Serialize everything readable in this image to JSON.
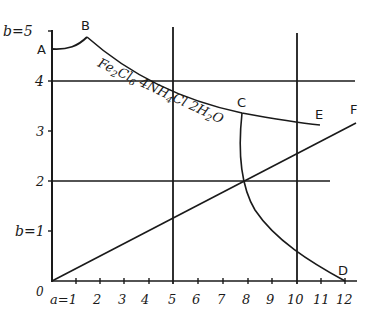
{
  "diagram": {
    "type": "phase-diagram",
    "y_axis": {
      "name": "b",
      "ticks": [
        {
          "label": "b=5",
          "value": 5
        },
        {
          "label": "4",
          "value": 4
        },
        {
          "label": "3",
          "value": 3
        },
        {
          "label": "2",
          "value": 2
        },
        {
          "label": "b=1",
          "value": 1
        }
      ],
      "origin_label": "0"
    },
    "x_axis": {
      "name": "a",
      "ticks": [
        {
          "label": "a=1",
          "value": 1
        },
        {
          "label": "2",
          "value": 2
        },
        {
          "label": "3",
          "value": 3
        },
        {
          "label": "4",
          "value": 4
        },
        {
          "label": "5",
          "value": 5
        },
        {
          "label": "6",
          "value": 6
        },
        {
          "label": "7",
          "value": 7
        },
        {
          "label": "8",
          "value": 8
        },
        {
          "label": "9",
          "value": 9
        },
        {
          "label": "10",
          "value": 10
        },
        {
          "label": "11",
          "value": 11
        },
        {
          "label": "12",
          "value": 12
        }
      ]
    },
    "points": {
      "A": "A",
      "B": "B",
      "C": "C",
      "D": "D",
      "E": "E",
      "F": "F"
    },
    "curve_label": "Fe2Cl6 4NH4Cl 2H2O",
    "curve_label_parts": {
      "fe": "Fe",
      "sub2": "2",
      "cl": "Cl",
      "sub6": "6",
      "four": " 4NH",
      "sub4": "4",
      "cl2": "Cl 2H",
      "sub2b": "2",
      "o": "O"
    },
    "reference_lines": {
      "horizontal": [
        4,
        2
      ],
      "vertical": [
        5,
        10
      ]
    }
  }
}
